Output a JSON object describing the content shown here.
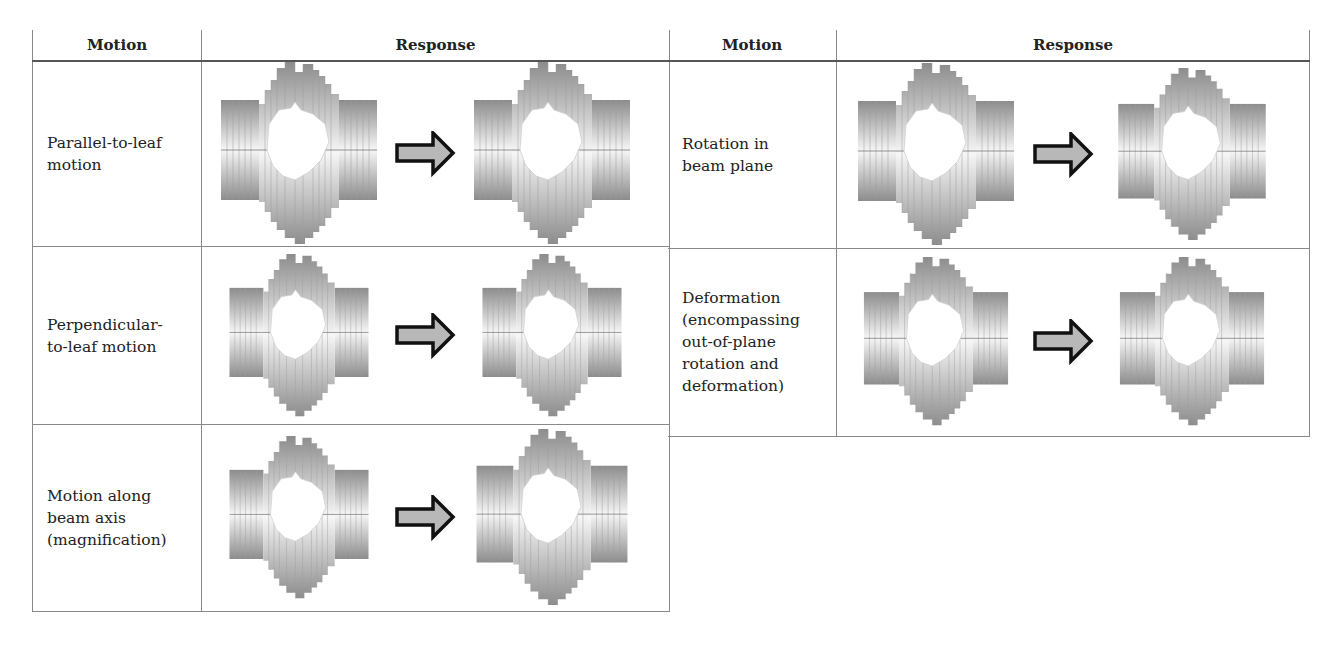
{
  "headers": {
    "motion": "Motion",
    "response": "Response"
  },
  "left_table": {
    "rows": [
      {
        "motion": "Parallel-to-leaf motion",
        "lines": [
          "Parallel-to-leaf",
          "motion"
        ]
      },
      {
        "motion": "Perpendicular-to-leaf motion",
        "lines": [
          "Perpendicular-",
          "to-leaf motion"
        ]
      },
      {
        "motion": "Motion along beam axis (magnification)",
        "lines": [
          "Motion along",
          "beam axis",
          "(magnification)"
        ]
      }
    ]
  },
  "right_table": {
    "rows": [
      {
        "motion": "Rotation in beam plane",
        "lines": [
          "Rotation in",
          "beam plane"
        ]
      },
      {
        "motion": "Deformation (encompassing out-of-plane rotation and deformation)",
        "lines": [
          "Deformation",
          "(encompassing",
          "out-of-plane",
          "rotation and",
          "deformation)"
        ]
      }
    ]
  },
  "icons": {
    "arrow": "right-arrow-icon",
    "collimator": "mlc-aperture-figure"
  },
  "colors": {
    "border": "#888888",
    "arrow_fill": "#b8b8b8",
    "arrow_stroke": "#111111",
    "leaf_dark": "#8a8a8a",
    "leaf_light": "#f4f4f4"
  }
}
